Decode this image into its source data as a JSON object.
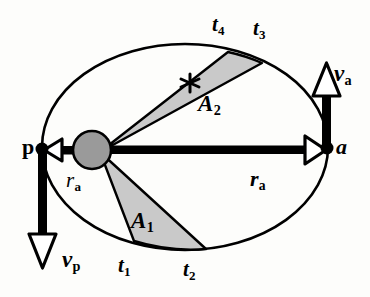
{
  "figure": {
    "kind": "orbital-ellipse-kepler-second-law",
    "background_color": "#fdfdfb",
    "stroke_color": "#000000",
    "sector_fill_color": "#c9c9c9",
    "sun_fill_color": "#9a9a9a"
  },
  "ellipse": {
    "center_x": 185,
    "center_y": 147,
    "radius_x": 143,
    "radius_y": 103,
    "stroke_width": 2.6
  },
  "focus": {
    "center_x": 92,
    "center_y": 150,
    "radius": 19,
    "apex_x": 100,
    "apex_y": 152
  },
  "points": {
    "perihelion": {
      "x": 42,
      "y": 148,
      "label": "p"
    },
    "aphelion": {
      "x": 327,
      "y": 147,
      "label": "a"
    }
  },
  "labels": {
    "perihelion": "p",
    "aphelion": "a",
    "radius_left": {
      "symbol": "r",
      "subscript": "a"
    },
    "radius_right": {
      "symbol": "r",
      "subscript": "a"
    },
    "velocity_perihelion": {
      "symbol": "v",
      "subscript": "p"
    },
    "velocity_aphelion": {
      "symbol": "v",
      "subscript": "a"
    },
    "time_1": {
      "symbol": "t",
      "subscript": "1"
    },
    "time_2": {
      "symbol": "t",
      "subscript": "2"
    },
    "time_3": {
      "symbol": "t",
      "subscript": "3"
    },
    "time_4": {
      "symbol": "t",
      "subscript": "4"
    },
    "area_1": {
      "symbol": "A",
      "subscript": "1"
    },
    "area_2": {
      "symbol": "A",
      "subscript": "2"
    }
  },
  "sectors": [
    {
      "name": "A1",
      "label": "A1",
      "start_time": "t1",
      "end_time": "t2",
      "apex_x": 100,
      "apex_y": 152,
      "t_start_x": 134,
      "t_start_y": 241,
      "t_end_x": 206,
      "t_end_y": 249,
      "arc_mid_x": 170,
      "arc_mid_y": 250
    },
    {
      "name": "A2",
      "label": "A2",
      "start_time": "t4",
      "end_time": "t3",
      "apex_x": 100,
      "apex_y": 152,
      "t_start_x": 228,
      "t_start_y": 52,
      "t_end_x": 262,
      "t_end_y": 63,
      "arc_mid_x": 245,
      "arc_mid_y": 56
    }
  ],
  "vectors": [
    {
      "name": "r_a_right",
      "from_x": 100,
      "from_y": 150,
      "to_x": 327,
      "to_y": 147,
      "direction": "right",
      "shaft_width": 8,
      "head_style": "hollow-triangle"
    },
    {
      "name": "r_p_left",
      "from_x": 100,
      "from_y": 150,
      "to_x": 42,
      "to_y": 148,
      "direction": "left",
      "shaft_width": 8,
      "head_style": "hollow-triangle"
    },
    {
      "name": "v_p",
      "from_x": 42,
      "from_y": 148,
      "to_x": 42,
      "to_y": 268,
      "direction": "down",
      "shaft_width": 8,
      "head_style": "hollow-triangle"
    },
    {
      "name": "v_a",
      "from_x": 327,
      "from_y": 147,
      "to_x": 327,
      "to_y": 63,
      "direction": "up",
      "shaft_width": 8,
      "head_style": "hollow-triangle"
    }
  ],
  "star_marker": {
    "x": 190,
    "y": 83,
    "size": 13
  }
}
